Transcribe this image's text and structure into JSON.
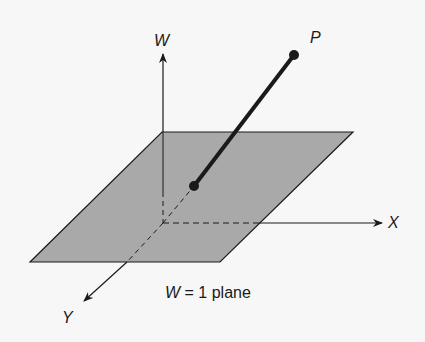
{
  "labels": {
    "w_axis": "W",
    "x_axis": "X",
    "y_axis": "Y",
    "point": "P",
    "plane_var": "W",
    "plane_rest": " = 1 plane"
  },
  "colors": {
    "background": "#f7f7f7",
    "plane_fill": "#a9a9a9",
    "stroke": "#1a1a1a"
  }
}
